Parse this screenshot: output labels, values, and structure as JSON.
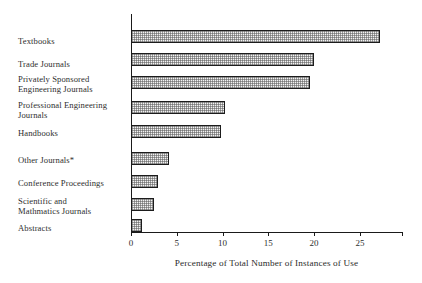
{
  "chart_data": {
    "type": "bar",
    "orientation": "horizontal",
    "title": "",
    "xlabel": "Percentage of Total Number of Instances of Use",
    "ylabel": "",
    "xlim": [
      0,
      29.6
    ],
    "grid": false,
    "legend": null,
    "xticks": [
      0,
      5,
      10,
      15,
      20,
      25
    ],
    "xticklabels": [
      "0",
      "5",
      "10",
      "15",
      "20",
      "25"
    ],
    "categories": [
      "Textbooks",
      "Trade Journals",
      "Privately Sponsored\nEngineering Journals",
      "Professional Engineering\nJournals",
      "Handbooks",
      "Other Journals*",
      "Conference Proceedings",
      "Scientific and\nMathmatics  Journals",
      "Abstracts"
    ],
    "values": [
      27.2,
      20.0,
      19.5,
      10.3,
      9.8,
      4.2,
      2.9,
      2.5,
      1.2
    ],
    "colors": {
      "bar_fill": "#f2f2f2",
      "bar_edge": "#1c1c1c",
      "axis": "#1a1a1a",
      "text": "#2e2e2e",
      "background": "#ffffff"
    }
  }
}
